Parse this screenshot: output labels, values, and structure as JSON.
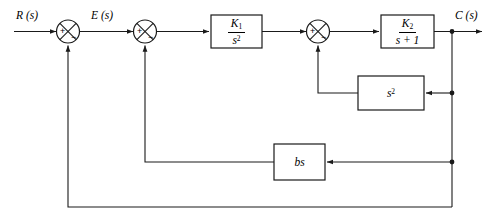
{
  "diagram": {
    "type": "block-diagram",
    "background_color": "#ffffff",
    "line_color": "#1a1a1a",
    "signals": {
      "input": {
        "name": "R",
        "arg": "(s)",
        "label": "R (s)"
      },
      "error": {
        "name": "E",
        "arg": "(s)",
        "label": "E (s)"
      },
      "output": {
        "name": "C",
        "arg": "(s)",
        "label": "C (s)"
      }
    },
    "summing_junctions": [
      {
        "id": "sum1",
        "positive_sign": "+",
        "negative_sign": "−",
        "positive_port": "left",
        "negative_port": "bottom"
      },
      {
        "id": "sum2",
        "positive_sign": "+",
        "negative_sign": "−",
        "positive_port": "left",
        "negative_port": "bottom"
      },
      {
        "id": "sum3",
        "positive_sign": "+",
        "negative_sign": "−",
        "positive_port": "left",
        "negative_port": "bottom"
      }
    ],
    "blocks": [
      {
        "id": "block-k1",
        "numerator": "K",
        "numerator_sub": "1",
        "denominator": "s",
        "denominator_sup": "2",
        "label": "K1/s^2",
        "path": "forward"
      },
      {
        "id": "block-k2",
        "numerator": "K",
        "numerator_sub": "2",
        "denominator": "s + 1",
        "denominator_sup": "",
        "label": "K2/(s+1)",
        "path": "forward"
      },
      {
        "id": "block-s2",
        "expression": "s",
        "exponent": "2",
        "label": "s^2",
        "path": "inner-feedback"
      },
      {
        "id": "block-bs",
        "expression": "bs",
        "exponent": "",
        "label": "bs",
        "path": "outer-feedback"
      }
    ],
    "feedback_paths": [
      {
        "id": "inner-loop",
        "from": "block-k2-output",
        "through": "block-s2",
        "to": "sum3-negative"
      },
      {
        "id": "middle-loop",
        "from": "block-k2-output",
        "through": "block-bs",
        "to": "sum2-negative"
      },
      {
        "id": "outer-loop",
        "from": "block-k2-output",
        "through": "unity",
        "to": "sum1-negative"
      }
    ]
  }
}
